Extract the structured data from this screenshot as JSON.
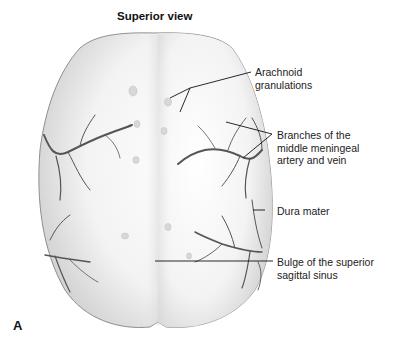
{
  "figure": {
    "title": "Superior view",
    "panel_label": "A",
    "labels": [
      {
        "id": "arachnoid",
        "line1": "Arachnoid",
        "line2": "granulations"
      },
      {
        "id": "branches",
        "line1": "Branches of the",
        "line2": "middle meningeal",
        "line3": "artery and vein"
      },
      {
        "id": "dura",
        "line1": "Dura mater"
      },
      {
        "id": "bulge",
        "line1": "Bulge of the superior",
        "line2": "sagittal sinus"
      }
    ]
  }
}
